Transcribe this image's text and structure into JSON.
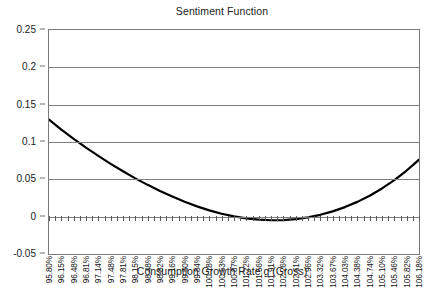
{
  "chart_data": {
    "type": "line",
    "title": "Sentiment Function",
    "xlabel": "Consumption Growth Rate g (Gross)",
    "ylabel": "",
    "ylim": [
      -0.05,
      0.25
    ],
    "ytick_labels": [
      "0.25",
      "0.2",
      "0.15",
      "0.1",
      "0.05",
      "0",
      "-0.05"
    ],
    "ytick_values": [
      0.25,
      0.2,
      0.15,
      0.1,
      0.05,
      0,
      -0.05
    ],
    "grid": true,
    "legend": "none",
    "categories": [
      "95.80%",
      "96.15%",
      "96.48%",
      "96.81%",
      "97.14%",
      "97.48%",
      "97.81%",
      "98.15%",
      "98.48%",
      "98.82%",
      "99.16%",
      "99.50%",
      "99.84%",
      "100.18%",
      "100.53%",
      "100.87%",
      "101.22%",
      "101.56%",
      "101.91%",
      "102.26%",
      "102.61%",
      "102.96%",
      "103.32%",
      "103.67%",
      "104.03%",
      "104.38%",
      "104.74%",
      "105.10%",
      "105.46%",
      "105.82%",
      "106.18%"
    ],
    "values": [
      0.13,
      0.1165,
      0.1042,
      0.0925,
      0.0815,
      0.0707,
      0.0609,
      0.0513,
      0.0426,
      0.0344,
      0.0269,
      0.02,
      0.0138,
      0.0084,
      0.0039,
      0.0004,
      -0.0022,
      -0.004,
      -0.0048,
      -0.0046,
      -0.0033,
      -0.001,
      0.0025,
      0.0071,
      0.0128,
      0.0198,
      0.0281,
      0.0378,
      0.049,
      0.0618,
      0.0763
    ],
    "series_name": "Sentiment",
    "line_color": "#000000",
    "grid_color": "#808080",
    "axis_color": "#7a7a7a"
  }
}
